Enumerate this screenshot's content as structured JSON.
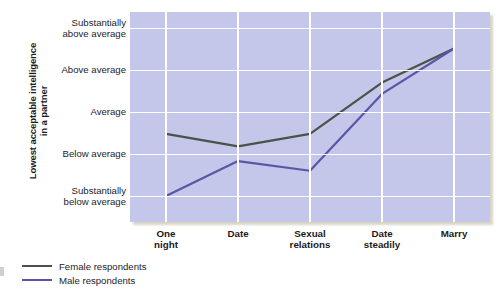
{
  "chart_data": {
    "type": "line",
    "title": "",
    "xlabel": "",
    "ylabel": "Lowest acceptable intelligence in a partner",
    "categories": [
      "One\nnight",
      "Date",
      "Sexual\nrelations",
      "Date\nsteadily",
      "Marry"
    ],
    "category_labels_flat": [
      "One night",
      "Date",
      "Sexual relations",
      "Date steadily",
      "Marry"
    ],
    "ytick_labels": [
      "Substantially\nbelow average",
      "Below average",
      "Average",
      "Above average",
      "Substantially\nabove average"
    ],
    "ytick_values": [
      1,
      2,
      3,
      4,
      5
    ],
    "ylim": [
      0.4,
      5.4
    ],
    "grid": true,
    "legend_position": "below-left",
    "series": [
      {
        "name": "Female respondents",
        "color": "#4b5249",
        "values": [
          2.5,
          2.2,
          2.5,
          3.72,
          4.53
        ]
      },
      {
        "name": "Male respondents",
        "color": "#5a55a6",
        "values": [
          1.02,
          1.85,
          1.62,
          3.45,
          4.53
        ]
      }
    ]
  },
  "axis": {
    "y_title_line1": "Lowest acceptable intelligence",
    "y_title_line2": "in a partner",
    "y_title_full": "Lowest acceptable intelligence in a partner"
  },
  "legend": {
    "items": [
      {
        "label": "Female respondents",
        "color": "#4b5249"
      },
      {
        "label": "Male respondents",
        "color": "#5a55a6"
      }
    ]
  },
  "colors": {
    "plot_background": "#c4c7e9",
    "gridline": "#ffffff",
    "female_line": "#4b5249",
    "male_line": "#5a55a6",
    "text": "#24242b",
    "shadow": "#b9b39a"
  }
}
